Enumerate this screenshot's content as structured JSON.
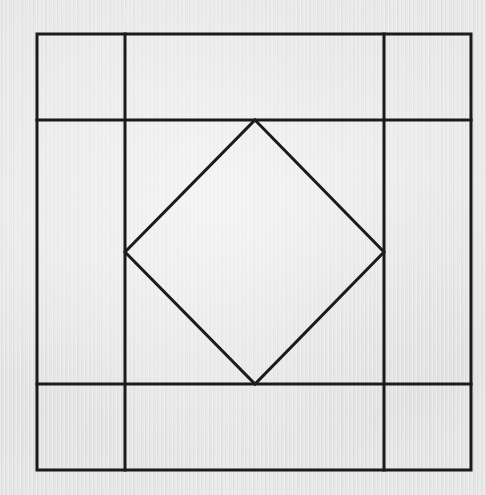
{
  "figure": {
    "medium": "pencil-on-paper line drawing (scanned)",
    "background_color": "#eeeeee",
    "line_color": "#1b1b1b",
    "line_width_px": 3,
    "canvas": {
      "width": 486,
      "height": 495
    },
    "outer_square": {
      "name": "outer-square",
      "left": 37,
      "top": 34,
      "right": 471,
      "bottom": 470,
      "width": 434,
      "height": 436
    },
    "grid_lines": [
      {
        "name": "vertical-line-left",
        "orientation": "vertical",
        "x": 125,
        "y1": 34,
        "y2": 470
      },
      {
        "name": "vertical-line-right",
        "orientation": "vertical",
        "x": 384,
        "y1": 34,
        "y2": 470
      },
      {
        "name": "horizontal-line-top",
        "orientation": "horizontal",
        "y": 120,
        "x1": 37,
        "x2": 471
      },
      {
        "name": "horizontal-line-bottom",
        "orientation": "horizontal",
        "y": 384,
        "x1": 37,
        "x2": 471
      }
    ],
    "inscribed_diamond": {
      "name": "inscribed-diamond",
      "points": "255,120 384,252 255,384 125,252",
      "vertices": [
        {
          "label": "top",
          "x": 255,
          "y": 120
        },
        {
          "label": "right",
          "x": 384,
          "y": 252
        },
        {
          "label": "bottom",
          "x": 255,
          "y": 384
        },
        {
          "label": "left",
          "x": 125,
          "y": 252
        }
      ]
    },
    "cells": [
      {
        "name": "cell-top-left",
        "row": "top",
        "col": "left"
      },
      {
        "name": "cell-top-center",
        "row": "top",
        "col": "center"
      },
      {
        "name": "cell-top-right",
        "row": "top",
        "col": "right"
      },
      {
        "name": "cell-middle-left",
        "row": "middle",
        "col": "left"
      },
      {
        "name": "cell-middle-center",
        "row": "middle",
        "col": "center"
      },
      {
        "name": "cell-middle-right",
        "row": "middle",
        "col": "right"
      },
      {
        "name": "cell-bottom-left",
        "row": "bottom",
        "col": "left"
      },
      {
        "name": "cell-bottom-center",
        "row": "bottom",
        "col": "center"
      },
      {
        "name": "cell-bottom-right",
        "row": "bottom",
        "col": "right"
      }
    ]
  }
}
